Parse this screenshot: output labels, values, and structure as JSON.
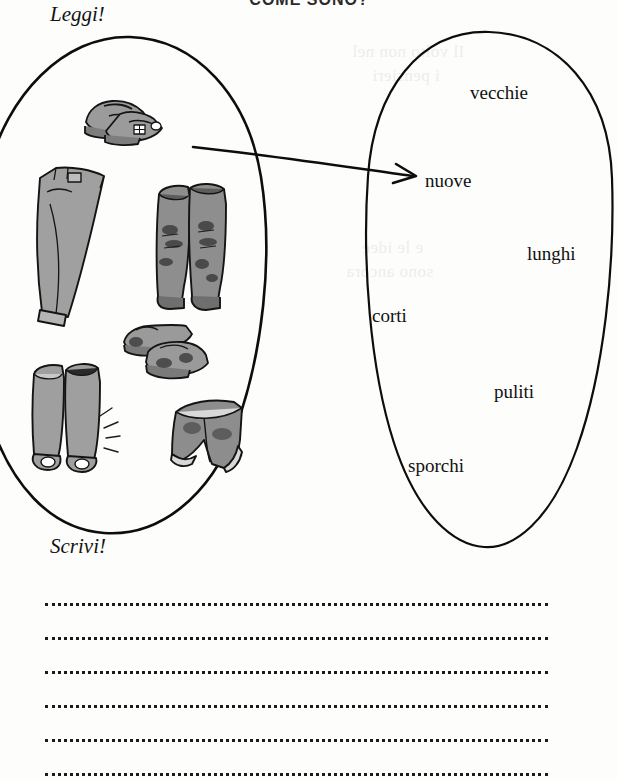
{
  "page": {
    "title": "COME SONO?",
    "background_color": "#fdfdfc",
    "ink_color": "#111111"
  },
  "cues": {
    "read_label": "Leggi!",
    "write_label": "Scrivi!"
  },
  "picture_oval": {
    "name": "picture-oval",
    "items": [
      {
        "id": "shoes-clean",
        "label": "scarpe pulite"
      },
      {
        "id": "trousers-long",
        "label": "pantaloni lunghi"
      },
      {
        "id": "boots-dirty",
        "label": "stivali sporchi"
      },
      {
        "id": "shoes-dirty",
        "label": "scarpe sporche"
      },
      {
        "id": "boots-clean",
        "label": "stivali puliti"
      },
      {
        "id": "shorts-short",
        "label": "pantaloncini corti"
      }
    ]
  },
  "word_oval": {
    "name": "word-oval",
    "words": [
      {
        "text": "vecchie",
        "x": 470,
        "y": 82
      },
      {
        "text": "nuove",
        "x": 425,
        "y": 170
      },
      {
        "text": "lunghi",
        "x": 527,
        "y": 243
      },
      {
        "text": "corti",
        "x": 372,
        "y": 305
      },
      {
        "text": "puliti",
        "x": 494,
        "y": 381
      },
      {
        "text": "sporchi",
        "x": 408,
        "y": 455
      }
    ]
  },
  "arrow": {
    "name": "match-arrow",
    "from": {
      "x": 193,
      "y": 147
    },
    "to": {
      "x": 415,
      "y": 176
    }
  },
  "writing_lines": {
    "count": 6,
    "style": "dotted"
  },
  "bleed_through": [
    {
      "text": "Il volto non nel",
      "x": 352,
      "y": 42
    },
    {
      "text": "i pensieri",
      "x": 372,
      "y": 66
    },
    {
      "text": "e le idee",
      "x": 362,
      "y": 238
    },
    {
      "text": "sono ancora",
      "x": 346,
      "y": 262
    }
  ]
}
